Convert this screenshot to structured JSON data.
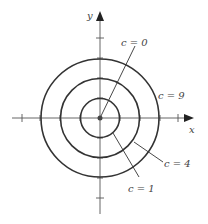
{
  "diagram": {
    "type": "level-curves",
    "axes": {
      "x_label": "x",
      "y_label": "y"
    },
    "center": [
      0,
      0
    ],
    "curves": [
      {
        "label": "c = 0",
        "radius": 0,
        "shape": "point"
      },
      {
        "label": "c = 1",
        "radius": 1,
        "shape": "circle"
      },
      {
        "label": "c = 4",
        "radius": 2,
        "shape": "circle"
      },
      {
        "label": "c = 9",
        "radius": 3,
        "shape": "circle"
      }
    ],
    "tick_marks": [
      -4,
      -3,
      -2,
      -1,
      1,
      2,
      3,
      4
    ]
  }
}
